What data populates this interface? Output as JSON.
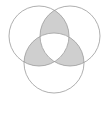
{
  "figure": {
    "caption": "",
    "background_color": "#ffffff",
    "stroke_color": "#9a9a9a",
    "stroke_width": 0.8,
    "shaded_fill": "#cfcfcf",
    "unshaded_fill": "#ffffff",
    "canvas": {
      "width": 109,
      "height": 120
    }
  },
  "chart_data": {
    "type": "venn",
    "set_count": 3,
    "radius": 30,
    "circles": [
      {
        "id": "A",
        "label": "",
        "cx": 39,
        "cy": 36,
        "r": 30,
        "position": "top-left",
        "fill": "#ffffff",
        "stroke": "#9a9a9a"
      },
      {
        "id": "B",
        "label": "",
        "cx": 70,
        "cy": 36,
        "r": 30,
        "position": "top-right",
        "fill": "#ffffff",
        "stroke": "#9a9a9a"
      },
      {
        "id": "C",
        "label": "",
        "cx": 54,
        "cy": 63,
        "r": 30,
        "position": "bottom-center",
        "fill": "#ffffff",
        "stroke": "#9a9a9a"
      }
    ],
    "regions": [
      {
        "id": "A-only",
        "sets": [
          "A"
        ],
        "shaded": false,
        "fill": "#ffffff"
      },
      {
        "id": "B-only",
        "sets": [
          "B"
        ],
        "shaded": false,
        "fill": "#ffffff"
      },
      {
        "id": "C-only",
        "sets": [
          "C"
        ],
        "shaded": false,
        "fill": "#ffffff"
      },
      {
        "id": "A-and-B",
        "sets": [
          "A",
          "B"
        ],
        "shaded": true,
        "fill": "#cfcfcf"
      },
      {
        "id": "A-and-C",
        "sets": [
          "A",
          "C"
        ],
        "shaded": true,
        "fill": "#cfcfcf"
      },
      {
        "id": "B-and-C",
        "sets": [
          "B",
          "C"
        ],
        "shaded": true,
        "fill": "#cfcfcf"
      },
      {
        "id": "A-and-B-and-C",
        "sets": [
          "A",
          "B",
          "C"
        ],
        "shaded": false,
        "fill": "#ffffff"
      }
    ],
    "shaded_description": "Exactly-two-set pairwise intersections are shaded; the central triple intersection and the single-set-only regions are unshaded.",
    "legend": [],
    "annotations": []
  }
}
